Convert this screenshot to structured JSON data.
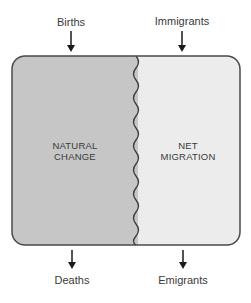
{
  "diagram": {
    "inputs": [
      {
        "label": "Births",
        "x": 58
      },
      {
        "label": "Immigrants",
        "x": 183
      }
    ],
    "outputs": [
      {
        "label": "Deaths",
        "x": 72
      },
      {
        "label": "Emigrants",
        "x": 183
      }
    ],
    "left_region": {
      "line1": "NATURAL",
      "line2": "CHANGE",
      "fill": "#c6c6c6"
    },
    "right_region": {
      "line1": "NET",
      "line2": "MIGRATION",
      "fill": "#ececec"
    },
    "border_color": "#4a4a4a",
    "arrow_color": "#1a1a1a"
  }
}
